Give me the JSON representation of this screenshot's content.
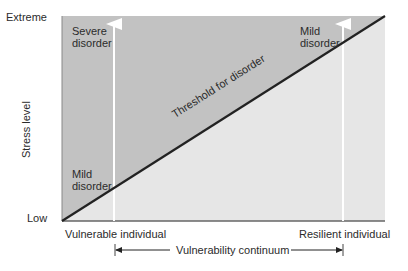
{
  "diagram": {
    "type": "diathesis-stress model",
    "colors": {
      "above_threshold": "#c2c2c2",
      "below_threshold": "#e6e6e6",
      "threshold_line": "#222222",
      "vertical_arrows": "#ffffff",
      "text": "#2b2b2b"
    },
    "y_axis": {
      "label": "Stress level",
      "top_tick": "Extreme",
      "bottom_tick": "Low"
    },
    "x_axis": {
      "left_label": "Vulnerable individual",
      "right_label": "Resilient individual",
      "continuum_label": "Vulnerability continuum"
    },
    "threshold_label": "Threshold for disorder",
    "annotations": {
      "left_top": [
        "Severe",
        "disorder"
      ],
      "left_bottom": [
        "Mild",
        "disorder"
      ],
      "right_top": [
        "Mild",
        "disorder"
      ]
    }
  }
}
